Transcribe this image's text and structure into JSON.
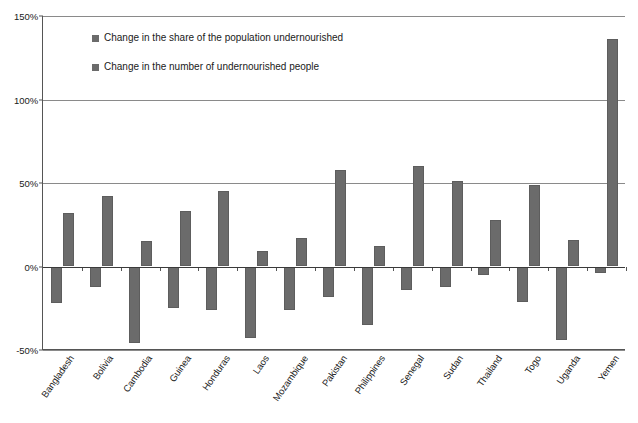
{
  "chart_data": {
    "type": "bar",
    "title": "",
    "xlabel": "",
    "ylabel": "",
    "ylim": [
      -50,
      150
    ],
    "yticks": [
      -50,
      0,
      50,
      100,
      150
    ],
    "ytick_labels": [
      "-50%",
      "0%",
      "50%",
      "100%",
      "150%"
    ],
    "grid": true,
    "legend_position": "inside-top-left",
    "bar_color": "#6b6b6b",
    "axis_color": "#555555",
    "gridline_color": "#8a8a8a",
    "categories": [
      "Bangladesh",
      "Bolivia",
      "Cambodia",
      "Guinea",
      "Honduras",
      "Laos",
      "Mozambique",
      "Pakistan",
      "Philippines",
      "Senegal",
      "Sudan",
      "Thailand",
      "Togo",
      "Uganda",
      "Yemen"
    ],
    "series": [
      {
        "name": "Change in the share of the population undernourished",
        "values": [
          -22,
          -12,
          -46,
          -25,
          -26,
          -43,
          -26,
          -18,
          -35,
          -14,
          -12,
          -5,
          -21,
          -44,
          -4
        ]
      },
      {
        "name": "Change in the number of undernourished people",
        "values": [
          32,
          42,
          15,
          33,
          45,
          9,
          17,
          58,
          12,
          60,
          51,
          28,
          49,
          16,
          136
        ]
      }
    ]
  },
  "legend": {
    "entries": [
      {
        "label": "Change in the share of the population undernourished",
        "swatch_name": "legend-swatch-share"
      },
      {
        "label": "Change in the number of undernourished people",
        "swatch_name": "legend-swatch-number"
      }
    ]
  },
  "caption": {
    "text": ""
  }
}
